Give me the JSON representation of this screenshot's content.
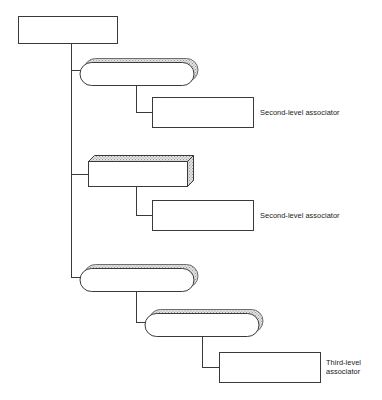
{
  "diagram": {
    "type": "hierarchy-tree",
    "background_color": "#ffffff",
    "stroke_color": "#3a3a3a",
    "shade_color": "#bdbdbd",
    "shade_light_color": "#d8d8d8",
    "fill_color": "#ffffff",
    "nodes": [
      {
        "id": "root-box",
        "shape": "rectangle",
        "label": "",
        "x": 18,
        "y": 16,
        "width": 99,
        "height": 27
      },
      {
        "id": "pill-1",
        "shape": "rounded-3d",
        "label": "",
        "x": 88,
        "y": 51,
        "width": 105,
        "height": 31
      },
      {
        "id": "second-level-box-1",
        "shape": "rectangle",
        "label": "",
        "x": 152,
        "y": 97,
        "width": 101,
        "height": 30
      },
      {
        "id": "box-3d-2",
        "shape": "box-3d",
        "label": "",
        "x": 88,
        "y": 155,
        "width": 105,
        "height": 31
      },
      {
        "id": "second-level-box-2",
        "shape": "rectangle",
        "label": "",
        "x": 152,
        "y": 200,
        "width": 101,
        "height": 30
      },
      {
        "id": "pill-3",
        "shape": "rounded-3d",
        "label": "",
        "x": 88,
        "y": 261,
        "width": 105,
        "height": 31
      },
      {
        "id": "pill-4",
        "shape": "rounded-3d",
        "label": "",
        "x": 153,
        "y": 306,
        "width": 105,
        "height": 31
      },
      {
        "id": "third-level-box",
        "shape": "rectangle",
        "label": "",
        "x": 219,
        "y": 352,
        "width": 101,
        "height": 30
      }
    ],
    "annotations": [
      {
        "id": "annotation-second-level-1",
        "text": "Second-level associator",
        "x": 260,
        "y": 108,
        "lines": 1
      },
      {
        "id": "annotation-second-level-2",
        "text": "Second-level associator",
        "x": 260,
        "y": 211,
        "lines": 1
      },
      {
        "id": "annotation-third-level",
        "text": "Third-level\nassociator",
        "x": 326,
        "y": 358,
        "lines": 2
      }
    ],
    "connectors": [
      {
        "id": "spine",
        "from": "root-box",
        "path": "M 71 43 L 71 277"
      },
      {
        "id": "spine-branch-pill-1",
        "from": "spine",
        "to": "pill-1",
        "path": "M 71 70 L 89 70"
      },
      {
        "id": "spine-branch-box-3d-2",
        "from": "spine",
        "to": "box-3d-2",
        "path": "M 71 174 L 89 174"
      },
      {
        "id": "spine-branch-pill-3",
        "from": "spine",
        "to": "pill-3",
        "path": "M 71 277 L 89 277"
      },
      {
        "id": "drop-pill-1",
        "from": "pill-1",
        "to": "second-level-box-1",
        "path": "M 136 82 L 136 112 L 153 112"
      },
      {
        "id": "drop-box-3d-2",
        "from": "box-3d-2",
        "to": "second-level-box-2",
        "path": "M 136 186 L 136 215 L 153 215"
      },
      {
        "id": "drop-pill-3",
        "from": "pill-3",
        "to": "pill-4",
        "path": "M 136 292 L 136 322 L 154 322"
      },
      {
        "id": "drop-pill-4",
        "from": "pill-4",
        "to": "third-level-box",
        "path": "M 202 337 L 202 367 L 220 367"
      }
    ]
  }
}
